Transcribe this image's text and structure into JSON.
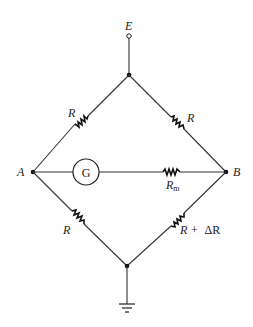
{
  "diagram": {
    "type": "Wheatstone bridge circuit",
    "labels": {
      "supply": "E",
      "node_left": "A",
      "node_right": "B",
      "galvanometer": "G",
      "r_top_left": "R",
      "r_top_right": "R",
      "r_bottom_left": "R",
      "r_bottom_right_main": "R + ",
      "r_bottom_right_delta": "ΔR",
      "meter_resistor_main": "R",
      "meter_resistor_sub": "m"
    },
    "colors": {
      "wire": "#333333",
      "background": "#ffffff"
    },
    "components": [
      {
        "id": "r1",
        "label": "R",
        "branch": "top-A"
      },
      {
        "id": "r2",
        "label": "R",
        "branch": "top-B"
      },
      {
        "id": "r3",
        "label": "R",
        "branch": "A-bottom"
      },
      {
        "id": "r4",
        "label": "R + ΔR",
        "branch": "B-bottom"
      },
      {
        "id": "g",
        "label": "G",
        "branch": "A-B (galvanometer)"
      },
      {
        "id": "rm",
        "label": "Rm",
        "branch": "A-B (meter resistance)"
      },
      {
        "id": "gnd",
        "label": "",
        "branch": "bottom node to ground"
      },
      {
        "id": "e",
        "label": "E",
        "branch": "supply terminal to top node"
      }
    ]
  }
}
